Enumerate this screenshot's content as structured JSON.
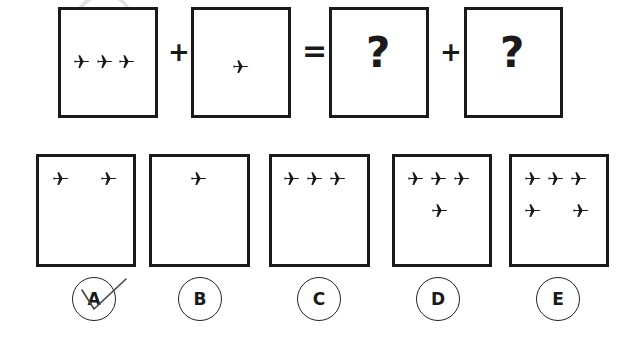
{
  "puzzle": {
    "question": {
      "boxes": [
        {
          "id": "q1",
          "planes": 3,
          "content": "✈✈✈"
        },
        {
          "id": "q2",
          "planes": 1,
          "content": "✈"
        },
        {
          "id": "q3",
          "content": "?"
        },
        {
          "id": "q4",
          "content": "?"
        }
      ],
      "operators": [
        "+",
        "=",
        "+"
      ]
    },
    "options": [
      {
        "label": "A",
        "planes": 2,
        "marked_correct": true
      },
      {
        "label": "B",
        "planes": 1,
        "marked_correct": false
      },
      {
        "label": "C",
        "planes": 3,
        "marked_correct": false
      },
      {
        "label": "D",
        "planes": 4,
        "marked_correct": false
      },
      {
        "label": "E",
        "planes": 5,
        "marked_correct": false
      }
    ],
    "watermark": "@"
  },
  "colors": {
    "ink": "#1a1a1a",
    "watermark": "#969696"
  }
}
